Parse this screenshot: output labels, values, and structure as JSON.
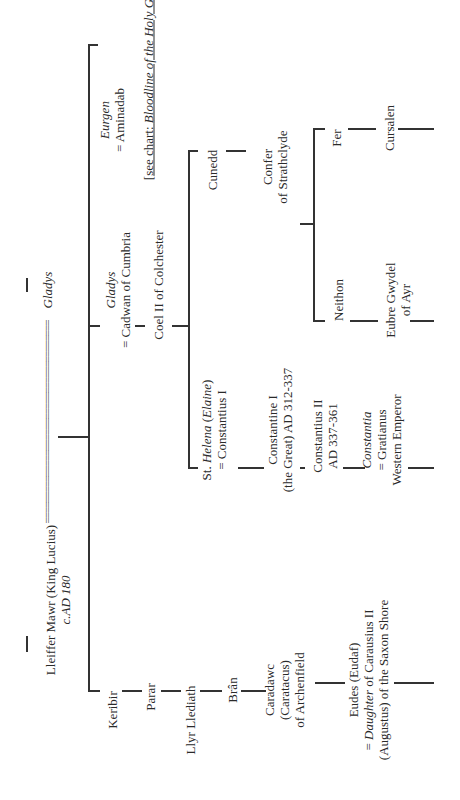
{
  "chart": {
    "root": {
      "name": "Lleiffer Mawr (King Lucius)",
      "date": "c.AD 180"
    },
    "marriage_line": "=======================================",
    "spouse": "Gladys",
    "gladys_branch": {
      "name": "Gladys",
      "spouse": "= Cadwan of Cumbria"
    },
    "eurgen_branch": {
      "name": "Eurgen",
      "spouse": "= Aminadab",
      "note_prefix": "[",
      "note_see": "see chart: ",
      "note_title": "Bloodline of the Holy Grail",
      "note_suffix": "]"
    },
    "coel": "Coel II of Colchester",
    "helena": {
      "name_st": "St. ",
      "name": "Helena",
      "paren_open": " (",
      "alt": "Elaine",
      "paren_close": ")",
      "spouse": "= Constantius I"
    },
    "constantine": {
      "line1": "Constantine I",
      "line2": "(the Great) AD 312-337"
    },
    "constantius2": {
      "line1": "Constantius II",
      "line2": "AD 337-361"
    },
    "constantia": {
      "name": "Constantia",
      "spouse": "= Gratianus",
      "title": "Western Emperor"
    },
    "cunedd": "Cunedd",
    "confer": {
      "line1": "Confer",
      "line2": "of Strathclyde"
    },
    "neithon": "Neithon",
    "eubre": {
      "line1": "Eubre Gwydel",
      "line2": "of Ayr"
    },
    "fer": "Fer",
    "cursalen": "Cursalen",
    "keribir": "Keribir",
    "parar": "Parar",
    "llyr": "Llyr Llediath",
    "bran": "Brân",
    "caradawc": {
      "line1": "Caradawc",
      "line2": "(Caratacus)",
      "line3": "of Archenfield"
    },
    "eudes": {
      "line1": "Eudes (Eudaf)",
      "line2_prefix": "= ",
      "line2_italic": "Daughter",
      "line2_rest": " of Carausius II",
      "line3": "(Augustus) of the Saxon Shore"
    }
  }
}
